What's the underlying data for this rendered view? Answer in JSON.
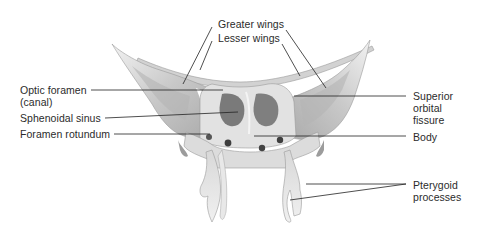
{
  "figure": {
    "colors": {
      "background": "#ffffff",
      "bone_light": "#ebebeb",
      "bone_mid": "#c9c9c9",
      "bone_dark": "#8f8f8f",
      "cavity": "#6e6e6e",
      "leader_line": "#222222",
      "text": "#2b2b2b"
    }
  },
  "labels": {
    "greater_wings": "Greater wings",
    "lesser_wings": "Lesser wings",
    "optic_foramen": [
      "Optic foramen",
      "(canal)"
    ],
    "sphenoidal_sinus": "Sphenoidal sinus",
    "foramen_rotundum": "Foramen rotundum",
    "superior_orbital_fissure": [
      "Superior",
      "orbital",
      "fissure"
    ],
    "body": "Body",
    "pterygoid_processes": [
      "Pterygoid",
      "processes"
    ]
  }
}
